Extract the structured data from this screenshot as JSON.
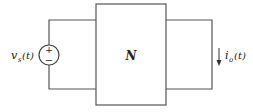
{
  "diagram": {
    "type": "circuit",
    "source": {
      "label_main": "v",
      "label_sub": "s",
      "label_arg": "(t)",
      "plus": "+",
      "minus": "−"
    },
    "network": {
      "label": "N"
    },
    "output": {
      "label_main": "i",
      "label_sub": "o",
      "label_arg": "(t)",
      "arrow_direction": "down"
    },
    "colors": {
      "wire": "#555555",
      "text": "#222222",
      "background": "#ffffff"
    }
  }
}
